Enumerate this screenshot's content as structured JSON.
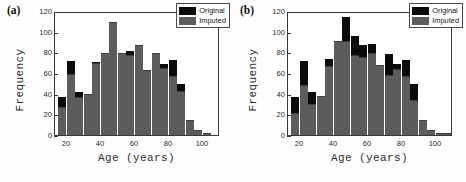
{
  "figure": {
    "background": "#fdfdfd",
    "colors": {
      "original": "#0b0b0b",
      "imputed": "#5c5c5c",
      "axis": "#3a3a3a"
    }
  },
  "panels": [
    {
      "label": "(a)",
      "legend": {
        "items": [
          {
            "label": "Original",
            "color": "#0b0b0b",
            "key": "original"
          },
          {
            "label": "Imputed",
            "color": "#5c5c5c",
            "key": "imputed"
          }
        ]
      },
      "chart_data": {
        "type": "bar",
        "title": "",
        "subtitle": "",
        "xlabel": "Age (years)",
        "ylabel": "Frequency",
        "xlim": [
          13,
          110
        ],
        "ylim": [
          0,
          120
        ],
        "xticks": [
          20,
          40,
          60,
          80,
          100
        ],
        "yticks": [
          0,
          20,
          40,
          60,
          80,
          100,
          120
        ],
        "grid": false,
        "legend_position": "top-right",
        "bin_width": 5,
        "bin_starts": [
          15,
          20,
          25,
          30,
          35,
          40,
          45,
          50,
          55,
          60,
          65,
          70,
          75,
          80,
          85,
          90,
          95,
          100,
          105
        ],
        "categories": [
          "15-20",
          "20-25",
          "25-30",
          "30-35",
          "35-40",
          "40-45",
          "45-50",
          "50-55",
          "55-60",
          "60-65",
          "65-70",
          "70-75",
          "75-80",
          "80-85",
          "85-90",
          "90-95",
          "95-100",
          "100-105",
          "105-110"
        ],
        "series": [
          {
            "name": "Original",
            "values": [
              37,
              72,
              42,
              39,
              71,
              78,
              109,
              78,
              81,
              86,
              62,
              78,
              69,
              73,
              49,
              14,
              4,
              1,
              0
            ]
          },
          {
            "name": "Imputed",
            "values": [
              26,
              58,
              36,
              39,
              69,
              78,
              108,
              78,
              76,
              86,
              62,
              78,
              64,
              56,
              42,
              14,
              4,
              1,
              0
            ]
          }
        ]
      }
    },
    {
      "label": "(b)",
      "legend": {
        "items": [
          {
            "label": "Original",
            "color": "#0b0b0b",
            "key": "original"
          },
          {
            "label": "Imputed",
            "color": "#5c5c5c",
            "key": "imputed"
          }
        ]
      },
      "chart_data": {
        "type": "bar",
        "title": "",
        "subtitle": "",
        "xlabel": "Age (years)",
        "ylabel": "Frequency",
        "xlim": [
          13,
          110
        ],
        "ylim": [
          0,
          120
        ],
        "xticks": [
          20,
          40,
          60,
          80,
          100
        ],
        "yticks": [
          0,
          20,
          40,
          60,
          80,
          100,
          120
        ],
        "grid": false,
        "legend_position": "top-right",
        "bin_width": 5,
        "bin_starts": [
          15,
          20,
          25,
          30,
          35,
          40,
          45,
          50,
          55,
          60,
          65,
          70,
          75,
          80,
          85,
          90,
          95,
          100,
          105
        ],
        "categories": [
          "15-20",
          "20-25",
          "25-30",
          "30-35",
          "35-40",
          "40-45",
          "45-50",
          "50-55",
          "55-60",
          "60-65",
          "65-70",
          "70-75",
          "75-80",
          "80-85",
          "85-90",
          "90-95",
          "95-100",
          "100-105",
          "105-110"
        ],
        "series": [
          {
            "name": "Original",
            "values": [
              37,
              72,
              42,
              37,
              74,
              90,
              114,
              96,
              87,
              88,
              67,
              78,
              69,
              73,
              49,
              14,
              4,
              1,
              1
            ]
          },
          {
            "name": "Imputed",
            "values": [
              20,
              47,
              29,
              37,
              66,
              90,
              90,
              76,
              75,
              78,
              67,
              57,
              63,
              56,
              33,
              14,
              4,
              1,
              1
            ]
          }
        ]
      }
    }
  ]
}
